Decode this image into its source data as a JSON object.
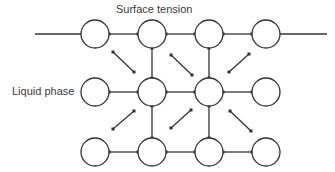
{
  "title": "Surface tension",
  "side_label": "Liquid phase",
  "colors": {
    "stroke": "#333333",
    "text": "#3a3a3a",
    "background": "#ffffff"
  },
  "molecules": {
    "radius": 14,
    "columns_x": [
      95,
      152,
      209,
      266
    ],
    "rows_y": [
      34,
      92,
      152
    ]
  },
  "boundary_lines": [
    {
      "x1": 35,
      "y1": 34,
      "x2": 81,
      "y2": 34
    },
    {
      "x1": 280,
      "y1": 34,
      "x2": 327,
      "y2": 34
    }
  ],
  "bonds": [
    {
      "x1": 109,
      "y1": 34,
      "x2": 138,
      "y2": 34
    },
    {
      "x1": 166,
      "y1": 34,
      "x2": 195,
      "y2": 34
    },
    {
      "x1": 223,
      "y1": 34,
      "x2": 252,
      "y2": 34
    },
    {
      "x1": 109,
      "y1": 92,
      "x2": 138,
      "y2": 92
    },
    {
      "x1": 166,
      "y1": 92,
      "x2": 195,
      "y2": 92
    },
    {
      "x1": 223,
      "y1": 92,
      "x2": 252,
      "y2": 92
    },
    {
      "x1": 109,
      "y1": 152,
      "x2": 138,
      "y2": 152
    },
    {
      "x1": 166,
      "y1": 152,
      "x2": 195,
      "y2": 152
    },
    {
      "x1": 223,
      "y1": 152,
      "x2": 252,
      "y2": 152
    },
    {
      "x1": 152,
      "y1": 48,
      "x2": 152,
      "y2": 78
    },
    {
      "x1": 209,
      "y1": 48,
      "x2": 209,
      "y2": 78
    },
    {
      "x1": 152,
      "y1": 106,
      "x2": 152,
      "y2": 138
    },
    {
      "x1": 209,
      "y1": 106,
      "x2": 209,
      "y2": 138
    }
  ],
  "diagonal_forces": [
    {
      "x1": 113,
      "y1": 52,
      "x2": 134,
      "y2": 72
    },
    {
      "x1": 171,
      "y1": 55,
      "x2": 192,
      "y2": 75
    },
    {
      "x1": 249,
      "y1": 54,
      "x2": 229,
      "y2": 72
    },
    {
      "x1": 134,
      "y1": 111,
      "x2": 113,
      "y2": 129
    },
    {
      "x1": 191,
      "y1": 110,
      "x2": 171,
      "y2": 128
    },
    {
      "x1": 230,
      "y1": 111,
      "x2": 251,
      "y2": 131
    }
  ]
}
